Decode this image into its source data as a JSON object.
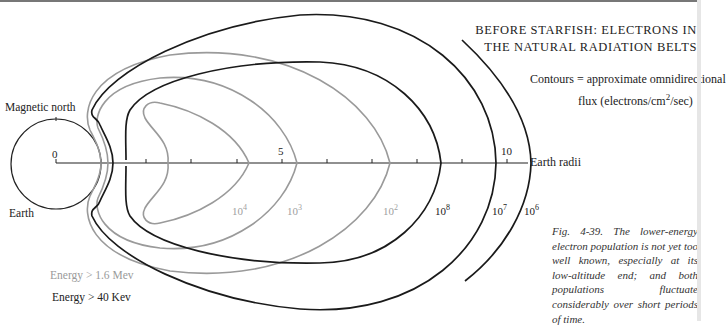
{
  "title": {
    "line1": "BEFORE STARFISH: ELECTRONS IN",
    "line2": "THE NATURAL RADIATION BELTS"
  },
  "legend": {
    "contours_line": "Contours = approximate omnidirectional",
    "flux_prefix": "flux (electrons/cm",
    "flux_sup": "2",
    "flux_suffix": "/sec)",
    "energy_high": "Energy > 1.6 Mev",
    "energy_low": "Energy > 40 Kev",
    "energy_high_color": "#9a9a9a",
    "energy_low_color": "#222222"
  },
  "labels": {
    "magnetic_north": "Magnetic north",
    "earth": "Earth",
    "axis_name": "Earth radii"
  },
  "axis": {
    "ticks": [
      {
        "value": "0",
        "x": 56
      },
      {
        "value": "5",
        "x": 282
      },
      {
        "value": "10",
        "x": 507
      }
    ],
    "minor_tick_x": [
      101,
      146,
      191,
      237,
      327,
      372,
      417,
      462
    ]
  },
  "contours": {
    "high_energy": [
      {
        "base": "10",
        "exp": "4"
      },
      {
        "base": "10",
        "exp": "3"
      },
      {
        "base": "10",
        "exp": "2"
      }
    ],
    "low_energy": [
      {
        "base": "10",
        "exp": "8"
      },
      {
        "base": "10",
        "exp": "7"
      },
      {
        "base": "10",
        "exp": "6"
      }
    ]
  },
  "caption": "Fig. 4-39. The lower-energy electron population is not yet too well known, especially at its low-altitude end; and both populations fluctuate considerably over short periods of time.",
  "colors": {
    "high_energy_line": "#9a9a9a",
    "low_energy_line": "#1a1a1a"
  }
}
